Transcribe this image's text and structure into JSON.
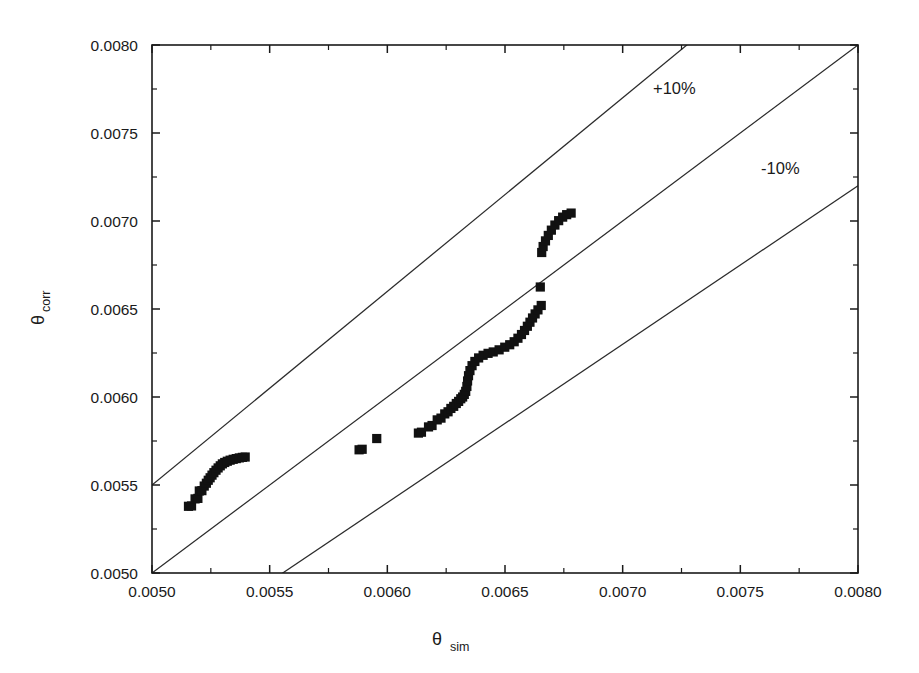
{
  "chart_data": {
    "type": "scatter",
    "title": "",
    "subtitle": "",
    "xlabel": "θ",
    "xlabel_sub": "sim",
    "ylabel": "θ",
    "ylabel_sub": "corr",
    "xlim": [
      0.005,
      0.008
    ],
    "ylim": [
      0.005,
      0.008
    ],
    "grid": false,
    "legend_position": "none",
    "xtick_labels": [
      "0.0050",
      "0.0055",
      "0.0060",
      "0.0065",
      "0.0070",
      "0.0075",
      "0.0080"
    ],
    "xtick_values": [
      0.005,
      0.0055,
      0.006,
      0.0065,
      0.007,
      0.0075,
      0.008
    ],
    "ytick_labels": [
      "0.0050",
      "0.0055",
      "0.0060",
      "0.0065",
      "0.0070",
      "0.0075",
      "0.0080"
    ],
    "ytick_values": [
      0.005,
      0.0055,
      0.006,
      0.0065,
      0.007,
      0.0075,
      0.008
    ],
    "minor_tick_interval": 0.00025,
    "marker_style": "filled-square",
    "marker_color": "#111111",
    "annotations": [
      {
        "text": "+10%",
        "x": 0.00722,
        "y": 0.00772,
        "name": "plus-ten-percent-label"
      },
      {
        "text": "-10%",
        "x": 0.00767,
        "y": 0.00727,
        "name": "minus-ten-percent-label"
      }
    ],
    "reference_lines": [
      {
        "name": "parity-line",
        "label": "1:1",
        "slope": 1.0,
        "intercept": 0.0
      },
      {
        "name": "plus-ten-percent-line",
        "label": "+10%",
        "slope": 1.1,
        "intercept": 0.0
      },
      {
        "name": "minus-ten-percent-line",
        "label": "-10%",
        "slope": 0.9,
        "intercept": 0.0
      }
    ],
    "series": [
      {
        "name": "theta_corr vs theta_sim",
        "points": [
          [
            0.005155,
            0.005379
          ],
          [
            0.005168,
            0.005381
          ],
          [
            0.005183,
            0.005421
          ],
          [
            0.005195,
            0.005424
          ],
          [
            0.005201,
            0.005466
          ],
          [
            0.005212,
            0.005468
          ],
          [
            0.005222,
            0.005494
          ],
          [
            0.005231,
            0.00551
          ],
          [
            0.005239,
            0.005527
          ],
          [
            0.005247,
            0.005541
          ],
          [
            0.005255,
            0.005556
          ],
          [
            0.005263,
            0.00557
          ],
          [
            0.005272,
            0.005584
          ],
          [
            0.005281,
            0.005597
          ],
          [
            0.00529,
            0.005609
          ],
          [
            0.005299,
            0.00562
          ],
          [
            0.005309,
            0.005628
          ],
          [
            0.00532,
            0.005635
          ],
          [
            0.005332,
            0.005641
          ],
          [
            0.005345,
            0.005646
          ],
          [
            0.005358,
            0.00565
          ],
          [
            0.005371,
            0.005654
          ],
          [
            0.005384,
            0.005657
          ],
          [
            0.005396,
            0.005659
          ],
          [
            0.00588,
            0.0057
          ],
          [
            0.005893,
            0.005703
          ],
          [
            0.005955,
            0.005764
          ],
          [
            0.006132,
            0.005795
          ],
          [
            0.006145,
            0.0058
          ],
          [
            0.006175,
            0.00583
          ],
          [
            0.00619,
            0.005838
          ],
          [
            0.006212,
            0.00587
          ],
          [
            0.006228,
            0.00588
          ],
          [
            0.006244,
            0.005904
          ],
          [
            0.006258,
            0.005916
          ],
          [
            0.00627,
            0.005935
          ],
          [
            0.006282,
            0.005947
          ],
          [
            0.006293,
            0.005963
          ],
          [
            0.006303,
            0.005975
          ],
          [
            0.006312,
            0.00599
          ],
          [
            0.00632,
            0.006
          ],
          [
            0.006327,
            0.006015
          ],
          [
            0.006333,
            0.006032
          ],
          [
            0.006338,
            0.00606
          ],
          [
            0.006341,
            0.006091
          ],
          [
            0.006345,
            0.006121
          ],
          [
            0.006351,
            0.00615
          ],
          [
            0.00636,
            0.006178
          ],
          [
            0.006372,
            0.006202
          ],
          [
            0.006388,
            0.006222
          ],
          [
            0.006407,
            0.006237
          ],
          [
            0.006428,
            0.006248
          ],
          [
            0.00645,
            0.006256
          ],
          [
            0.006475,
            0.006268
          ],
          [
            0.006499,
            0.006283
          ],
          [
            0.00652,
            0.006297
          ],
          [
            0.006539,
            0.006314
          ],
          [
            0.006555,
            0.006334
          ],
          [
            0.00657,
            0.006355
          ],
          [
            0.006583,
            0.006378
          ],
          [
            0.006595,
            0.006402
          ],
          [
            0.006606,
            0.006425
          ],
          [
            0.006617,
            0.006449
          ],
          [
            0.006628,
            0.006472
          ],
          [
            0.00664,
            0.006495
          ],
          [
            0.006654,
            0.00652
          ],
          [
            0.00665,
            0.006625
          ],
          [
            0.006656,
            0.006821
          ],
          [
            0.006662,
            0.006855
          ],
          [
            0.006672,
            0.006887
          ],
          [
            0.006684,
            0.006918
          ],
          [
            0.006697,
            0.006948
          ],
          [
            0.006712,
            0.006977
          ],
          [
            0.006728,
            0.007002
          ],
          [
            0.006745,
            0.007022
          ],
          [
            0.006762,
            0.007036
          ],
          [
            0.006781,
            0.007045
          ]
        ]
      }
    ],
    "cluster_summary": [
      {
        "name": "low-cluster",
        "x_range": [
          0.00515,
          0.0054
        ],
        "y_range": [
          0.00538,
          0.00566
        ],
        "count": 24
      },
      {
        "name": "isolated-points",
        "x_range": [
          0.00588,
          0.00596
        ],
        "y_range": [
          0.0057,
          0.00577
        ],
        "count": 3
      },
      {
        "name": "main-cluster",
        "x_range": [
          0.00613,
          0.00666
        ],
        "y_range": [
          0.00579,
          0.00663
        ],
        "count": 39
      },
      {
        "name": "high-cluster",
        "x_range": [
          0.00665,
          0.00679
        ],
        "y_range": [
          0.00682,
          0.00705
        ],
        "count": 11
      }
    ]
  },
  "axes": {
    "x_axis_name": "x-axis",
    "y_axis_name": "y-axis"
  },
  "colors": {
    "background": "#ffffff",
    "foreground": "#1a1a1a",
    "marker": "#111111",
    "reference_line": "#2b2b2b"
  }
}
